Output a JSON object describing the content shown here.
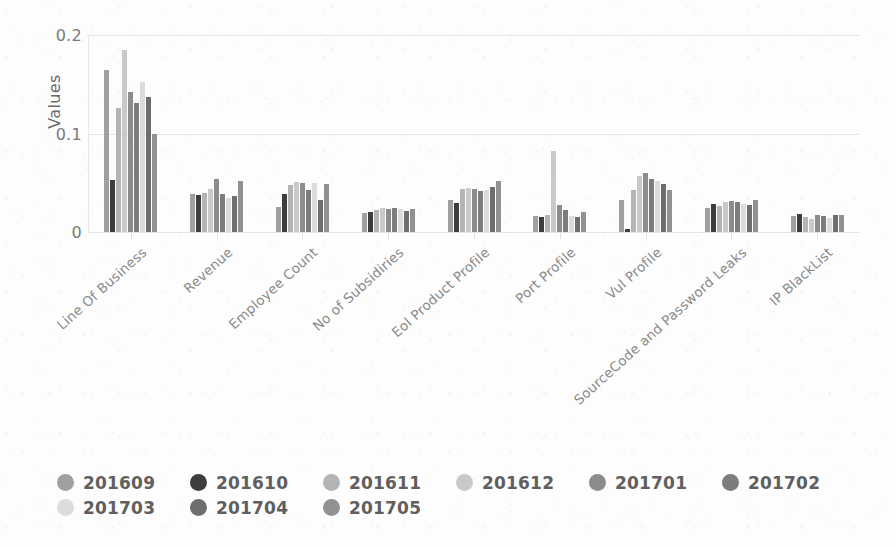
{
  "chart_data": {
    "type": "bar",
    "title": "",
    "subtitle": "",
    "xlabel": "",
    "ylabel": "Values",
    "ylim": [
      0,
      0.2
    ],
    "yticks": [
      "0",
      "0.1",
      "0.2"
    ],
    "ytick_values": [
      0,
      0.1,
      0.2
    ],
    "grid": true,
    "legend_position": "bottom",
    "orientation": "vertical",
    "grouped": true,
    "categories": [
      "Line Of Business",
      "Revenue",
      "Employee Count",
      "No of Subsidiries",
      "Eol Product Profile",
      "Port Profile",
      "Vul Profile",
      "SourceCode and Password Leaks",
      "IP BlackList"
    ],
    "series": [
      {
        "name": "201609",
        "color": "#a0a0a0",
        "values": [
          0.164,
          0.039,
          0.025,
          0.019,
          0.033,
          0.016,
          0.032,
          0.024,
          0.016
        ]
      },
      {
        "name": "201610",
        "color": "#3d3d3d",
        "values": [
          0.053,
          0.038,
          0.039,
          0.02,
          0.029,
          0.015,
          0.003,
          0.028,
          0.018
        ]
      },
      {
        "name": "201611",
        "color": "#b4b4b4",
        "values": [
          0.126,
          0.04,
          0.048,
          0.022,
          0.044,
          0.017,
          0.043,
          0.026,
          0.015
        ]
      },
      {
        "name": "201612",
        "color": "#c9c9c9",
        "values": [
          0.185,
          0.044,
          0.051,
          0.024,
          0.045,
          0.082,
          0.057,
          0.03,
          0.013
        ]
      },
      {
        "name": "201701",
        "color": "#8c8c8c",
        "values": [
          0.142,
          0.054,
          0.05,
          0.023,
          0.044,
          0.027,
          0.06,
          0.031,
          0.017
        ]
      },
      {
        "name": "201702",
        "color": "#7d7d7d",
        "values": [
          0.131,
          0.039,
          0.043,
          0.024,
          0.042,
          0.022,
          0.054,
          0.03,
          0.016
        ]
      },
      {
        "name": "201703",
        "color": "#dcdcdc",
        "values": [
          0.152,
          0.035,
          0.05,
          0.023,
          0.043,
          0.016,
          0.052,
          0.028,
          0.014
        ]
      },
      {
        "name": "201704",
        "color": "#6e6e6e",
        "values": [
          0.137,
          0.037,
          0.032,
          0.021,
          0.046,
          0.015,
          0.049,
          0.027,
          0.017
        ]
      },
      {
        "name": "201705",
        "color": "#919191",
        "values": [
          0.1,
          0.052,
          0.049,
          0.023,
          0.052,
          0.02,
          0.043,
          0.033,
          0.017
        ]
      }
    ]
  },
  "legend": {
    "items": [
      {
        "label": "201609",
        "swatch": "legend-dot-201609"
      },
      {
        "label": "201610",
        "swatch": "legend-dot-201610"
      },
      {
        "label": "201611",
        "swatch": "legend-dot-201611"
      },
      {
        "label": "201612",
        "swatch": "legend-dot-201612"
      },
      {
        "label": "201701",
        "swatch": "legend-dot-201701"
      },
      {
        "label": "201702",
        "swatch": "legend-dot-201702"
      },
      {
        "label": "201703",
        "swatch": "legend-dot-201703"
      },
      {
        "label": "201704",
        "swatch": "legend-dot-201704"
      },
      {
        "label": "201705",
        "swatch": "legend-dot-201705"
      }
    ]
  },
  "colors": {
    "background": "#fdfdfd",
    "gridline": "#e4e4e4",
    "axis_text": "#7a7a7a",
    "label_text": "#8a8a8a",
    "legend_text": "#5f5f5f"
  }
}
